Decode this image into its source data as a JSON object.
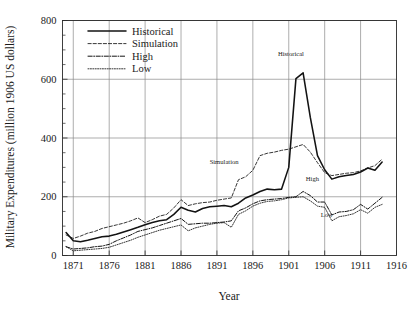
{
  "figure": {
    "background_color": "#ffffff",
    "line_color": "#131313",
    "grid_color": "#8a8a8a"
  },
  "axes": {
    "x_title": "Year",
    "y_title": "Military Expenditures (million 1906 US dollars)",
    "x_ticks": [
      "1871",
      "1876",
      "1881",
      "1886",
      "1891",
      "1896",
      "1901",
      "1906",
      "1911",
      "1916"
    ],
    "y_ticks": [
      "0",
      "200",
      "400",
      "600",
      "800"
    ]
  },
  "legend": {
    "items": [
      {
        "label": "Historical",
        "style": "solid"
      },
      {
        "label": "Simulation",
        "style": "dashed"
      },
      {
        "label": "High",
        "style": "dash-dot"
      },
      {
        "label": "Low",
        "style": "dotted"
      }
    ]
  },
  "annotations": [
    {
      "name": "historical",
      "text": "Historical",
      "x": 1901.3,
      "y": 680
    },
    {
      "name": "simulation",
      "text": "Simulation",
      "x": 1892.0,
      "y": 312
    },
    {
      "name": "high",
      "text": "High",
      "x": 1904.3,
      "y": 253
    },
    {
      "name": "low",
      "text": "Low",
      "x": 1906.3,
      "y": 131
    }
  ],
  "chart_data": {
    "type": "line",
    "title": "",
    "xlabel": "Year",
    "ylabel": "Military Expenditures (million 1906 US dollars)",
    "xlim": [
      1869.5,
      1916
    ],
    "ylim": [
      0,
      800
    ],
    "xticks": [
      1871,
      1876,
      1881,
      1886,
      1891,
      1896,
      1901,
      1906,
      1911,
      1916
    ],
    "yticks": [
      0,
      200,
      400,
      600,
      800
    ],
    "grid": true,
    "legend_position": "top-left-inside",
    "x": [
      1870,
      1871,
      1872,
      1873,
      1874,
      1875,
      1876,
      1877,
      1878,
      1879,
      1880,
      1881,
      1882,
      1883,
      1884,
      1885,
      1886,
      1887,
      1888,
      1889,
      1890,
      1891,
      1892,
      1893,
      1894,
      1895,
      1896,
      1897,
      1898,
      1899,
      1900,
      1901,
      1902,
      1903,
      1904,
      1905,
      1906,
      1907,
      1908,
      1909,
      1910,
      1911,
      1912,
      1913,
      1914
    ],
    "series": [
      {
        "name": "Historical",
        "style": "solid",
        "values": [
          78,
          50,
          47,
          52,
          58,
          64,
          66,
          72,
          80,
          88,
          96,
          105,
          112,
          118,
          122,
          140,
          164,
          154,
          148,
          160,
          166,
          168,
          170,
          166,
          178,
          196,
          206,
          218,
          226,
          224,
          226,
          300,
          602,
          622,
          470,
          340,
          292,
          260,
          268,
          272,
          276,
          284,
          298,
          290,
          318
        ]
      },
      {
        "name": "Simulation",
        "style": "dashed",
        "values": [
          70,
          58,
          66,
          76,
          82,
          92,
          98,
          104,
          110,
          118,
          128,
          112,
          122,
          134,
          140,
          162,
          190,
          170,
          176,
          180,
          182,
          188,
          192,
          196,
          258,
          268,
          290,
          340,
          348,
          352,
          358,
          362,
          370,
          378,
          352,
          316,
          282,
          272,
          276,
          280,
          282,
          288,
          298,
          306,
          328
        ]
      },
      {
        "name": "High",
        "style": "dash-dot",
        "values": [
          30,
          22,
          24,
          26,
          30,
          32,
          38,
          50,
          60,
          70,
          82,
          88,
          94,
          102,
          110,
          118,
          126,
          106,
          108,
          110,
          110,
          112,
          114,
          118,
          152,
          162,
          176,
          186,
          190,
          192,
          194,
          198,
          200,
          218,
          204,
          182,
          182,
          138,
          148,
          150,
          156,
          174,
          158,
          178,
          198
        ]
      },
      {
        "name": "Low",
        "style": "dotted",
        "values": [
          30,
          16,
          18,
          20,
          22,
          24,
          28,
          36,
          44,
          52,
          62,
          70,
          78,
          86,
          92,
          98,
          104,
          84,
          94,
          100,
          106,
          110,
          112,
          96,
          140,
          152,
          168,
          178,
          184,
          186,
          190,
          196,
          198,
          200,
          186,
          168,
          164,
          118,
          132,
          136,
          142,
          156,
          144,
          164,
          174
        ]
      }
    ]
  }
}
